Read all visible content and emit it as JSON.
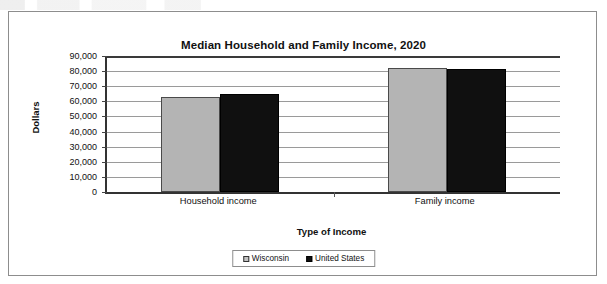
{
  "chart_data": {
    "type": "bar",
    "title": "Median Household and Family Income, 2020",
    "xlabel": "Type of Income",
    "ylabel": "Dollars",
    "categories": [
      "Household income",
      "Family income"
    ],
    "series": [
      {
        "name": "Wisconsin",
        "values": [
          63000,
          82200
        ]
      },
      {
        "name": "United States",
        "values": [
          64900,
          81500
        ]
      }
    ],
    "ylim": [
      0,
      90000
    ],
    "ytick_labels": [
      "90,000",
      "80,000",
      "70,000",
      "60,000",
      "50,000",
      "40,000",
      "30,000",
      "20,000",
      "10,000",
      "0"
    ],
    "ytick_values": [
      90000,
      80000,
      70000,
      60000,
      50000,
      40000,
      30000,
      20000,
      10000,
      0
    ],
    "grid": true,
    "legend_position": "bottom",
    "colors": {
      "series_0": "#b4b4b4",
      "series_1": "#101010",
      "gridline": "#9a9a9a",
      "axis": "#333333",
      "frame": "#8d8d8d",
      "text": "#111111"
    }
  }
}
